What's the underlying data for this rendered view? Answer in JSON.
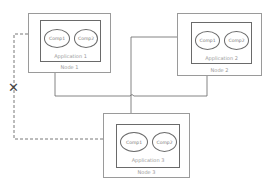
{
  "diagram": {
    "type": "deployment",
    "nodes": [
      {
        "label": "Node 1",
        "application": "Application 1",
        "components": [
          "Comp1",
          "Comp2"
        ]
      },
      {
        "label": "Node 2",
        "application": "Application 2",
        "components": [
          "Comp1",
          "Comp2"
        ]
      },
      {
        "label": "Node 3",
        "application": "Application 3",
        "components": [
          "Comp1",
          "Comp2"
        ]
      }
    ],
    "connections": [
      {
        "from": "Node 1 / Comp1",
        "to": "Node 3 / Comp1",
        "style": "solid"
      },
      {
        "from": "Node 2 / Comp1",
        "to": "Node 3 / Comp1",
        "style": "solid"
      },
      {
        "from": "Node 3 / Comp1",
        "to": "Node 2 / Comp1",
        "style": "solid",
        "arrow": true
      },
      {
        "from": "Node 1 / Comp1",
        "to": "Node 3 / Comp1",
        "style": "dashed",
        "arrow": true,
        "status": "broken"
      }
    ],
    "broken_marker": "✕",
    "colors": {
      "node_border": "#9a9a9a",
      "app_border": "#6a6a6a",
      "wire": "#555555",
      "label": "#9a9a9a"
    }
  }
}
